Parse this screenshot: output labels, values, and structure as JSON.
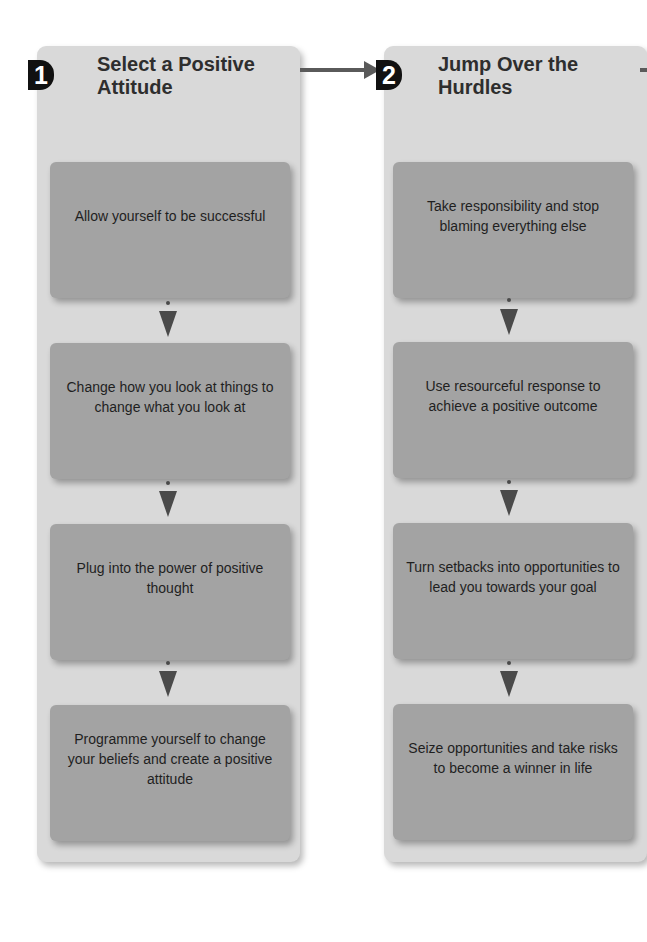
{
  "colors": {
    "panel_bg": "#d9d9d9",
    "box_bg": "#a3a3a3",
    "badge_bg": "#111111",
    "arrow": "#4a4a4a",
    "text": "#1f1f1f"
  },
  "steps": [
    {
      "number": "1",
      "title": "Select a Positive Attitude",
      "items": [
        "Allow yourself to be successful",
        "Change how you look at things to change what you look at",
        "Plug into the power of positive thought",
        "Programme yourself to change your beliefs and create a positive attitude"
      ]
    },
    {
      "number": "2",
      "title": "Jump Over the Hurdles",
      "items": [
        "Take responsibility and stop blaming everything else",
        "Use resourceful response to achieve a positive outcome",
        "Turn setbacks into opportunities to lead you towards your goal",
        "Seize opportunities and take risks to become a winner in life"
      ]
    }
  ]
}
